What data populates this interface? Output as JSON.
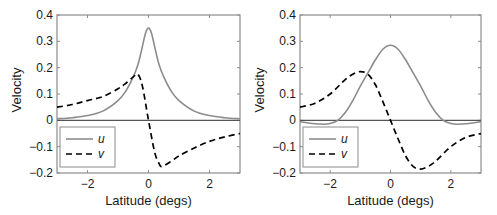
{
  "colors": {
    "u_line": "#8c8c8c",
    "v_line": "#000000",
    "axis": "#8c8c8c",
    "zero_line": "#555555"
  },
  "chart_data": [
    {
      "type": "line",
      "title": "",
      "xlabel": "Latitude (degs)",
      "ylabel": "Velocity",
      "xlim": [
        -3,
        3
      ],
      "ylim": [
        -0.2,
        0.4
      ],
      "xticks": [
        -2,
        0,
        2
      ],
      "xtick_labels": [
        "−2",
        "0",
        "2"
      ],
      "yticks": [
        -0.2,
        -0.1,
        0,
        0.1,
        0.2,
        0.3,
        0.4
      ],
      "ytick_labels": [
        "−0.2",
        "−0.1",
        "0",
        "0.1",
        "0.2",
        "0.3",
        "0.4"
      ],
      "grid": false,
      "legend_position": "lower left",
      "series": [
        {
          "name": "u",
          "style": "solid",
          "x": [
            -3,
            -2.5,
            -2,
            -1.5,
            -1,
            -0.75,
            -0.5,
            -0.35,
            -0.25,
            -0.1,
            0,
            0.1,
            0.25,
            0.35,
            0.5,
            0.75,
            1,
            1.5,
            2,
            2.5,
            3
          ],
          "y": [
            0.006,
            0.01,
            0.018,
            0.035,
            0.075,
            0.11,
            0.165,
            0.21,
            0.255,
            0.33,
            0.35,
            0.33,
            0.255,
            0.21,
            0.165,
            0.11,
            0.075,
            0.035,
            0.018,
            0.01,
            0.006
          ]
        },
        {
          "name": "v",
          "style": "dashed",
          "x": [
            -3,
            -2.5,
            -2,
            -1.5,
            -1,
            -0.75,
            -0.5,
            -0.35,
            -0.2,
            0,
            0.2,
            0.35,
            0.45,
            0.75,
            1,
            1.5,
            2,
            2.5,
            3
          ],
          "y": [
            0.05,
            0.06,
            0.075,
            0.09,
            0.12,
            0.14,
            0.165,
            0.175,
            0.13,
            0.0,
            -0.12,
            -0.165,
            -0.175,
            -0.155,
            -0.135,
            -0.105,
            -0.08,
            -0.063,
            -0.05
          ]
        }
      ]
    },
    {
      "type": "line",
      "title": "",
      "xlabel": "Latitude (degs)",
      "ylabel": "Velocity",
      "xlim": [
        -3,
        3
      ],
      "ylim": [
        -0.2,
        0.4
      ],
      "xticks": [
        -2,
        0,
        2
      ],
      "xtick_labels": [
        "−2",
        "0",
        "2"
      ],
      "yticks": [
        -0.2,
        -0.1,
        0,
        0.1,
        0.2,
        0.3,
        0.4
      ],
      "ytick_labels": [
        "−0.2",
        "−0.1",
        "0",
        "0.1",
        "0.2",
        "0.3",
        "0.4"
      ],
      "grid": false,
      "legend_position": "lower left",
      "series": [
        {
          "name": "u",
          "style": "solid",
          "x": [
            -3,
            -2.6,
            -2.2,
            -2,
            -1.75,
            -1.5,
            -1.25,
            -1,
            -0.75,
            -0.5,
            -0.25,
            0,
            0.25,
            0.5,
            0.75,
            1,
            1.25,
            1.5,
            1.75,
            2,
            2.2,
            2.6,
            3
          ],
          "y": [
            -0.005,
            -0.012,
            -0.015,
            -0.012,
            0.0,
            0.03,
            0.075,
            0.13,
            0.18,
            0.23,
            0.27,
            0.285,
            0.27,
            0.23,
            0.18,
            0.13,
            0.075,
            0.03,
            0.0,
            -0.012,
            -0.015,
            -0.012,
            -0.005
          ]
        },
        {
          "name": "v",
          "style": "dashed",
          "x": [
            -3,
            -2.5,
            -2,
            -1.5,
            -1.25,
            -1,
            -0.75,
            -0.5,
            -0.25,
            0,
            0.25,
            0.5,
            0.75,
            1,
            1.25,
            1.5,
            2,
            2.5,
            3
          ],
          "y": [
            0.05,
            0.065,
            0.1,
            0.155,
            0.175,
            0.185,
            0.175,
            0.135,
            0.07,
            0.0,
            -0.07,
            -0.135,
            -0.175,
            -0.185,
            -0.175,
            -0.155,
            -0.1,
            -0.065,
            -0.05
          ]
        }
      ]
    }
  ]
}
